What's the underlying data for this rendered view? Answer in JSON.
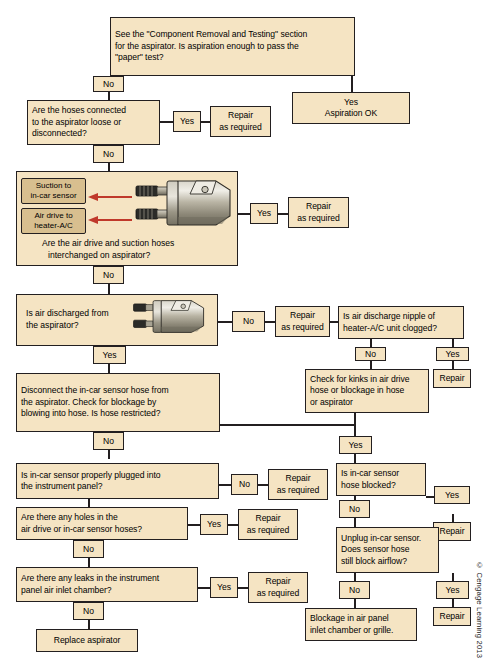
{
  "diagram": {
    "copyright": "© Cengage Learning 2013",
    "colors": {
      "box_fill": "#f5e4c3",
      "box_border": "#231f20",
      "label_fill": "#d8bf8f",
      "arrow_red": "#c0392b",
      "page_bg": "#ffffff"
    }
  },
  "nodes": {
    "start": {
      "line1": "See the \"Component Removal and Testing\" section",
      "line2": "for the aspirator. Is aspiration enough to pass the",
      "line3": "\"paper\" test?"
    },
    "aspiration_ok": {
      "line1": "Yes",
      "line2": "Aspiration OK"
    },
    "hoses_connected": {
      "line1": "Are the hoses connected",
      "line2": "to the aspirator loose or",
      "line3": "disconnected?"
    },
    "repair1": {
      "line1": "Repair",
      "line2": "as required"
    },
    "interchanged": {
      "caption1": "Are the air drive and suction hoses",
      "caption2": "interchanged on aspirator?",
      "label_suction_1": "Suction to",
      "label_suction_2": "in-car sensor",
      "label_airdrive_1": "Air drive to",
      "label_airdrive_2": "heater-A/C"
    },
    "repair2": {
      "line1": "Repair",
      "line2": "as required"
    },
    "air_discharged": {
      "line1": "Is air discharged from",
      "line2": "the aspirator?"
    },
    "repair3": {
      "line1": "Repair",
      "line2": "as required"
    },
    "nipple_clogged": {
      "line1": "Is air discharge nipple of",
      "line2": "heater-A/C unit clogged?"
    },
    "repair4": {
      "line1": "Repair"
    },
    "check_kinks": {
      "line1": "Check for kinks in air drive",
      "line2": "hose or blockage in hose",
      "line3": "or aspirator"
    },
    "disconnect_hose": {
      "line1": "Disconnect the in-car sensor hose from",
      "line2": "the aspirator. Check for blockage by",
      "line3": "blowing into hose. Is hose restricted?"
    },
    "sensor_plugged": {
      "line1": "Is in-car sensor properly plugged into",
      "line2": "the instrument panel?"
    },
    "repair5": {
      "line1": "Repair",
      "line2": "as required"
    },
    "hose_blocked": {
      "line1": "Is in-car sensor",
      "line2": "hose blocked?"
    },
    "repair6": {
      "line1": "Repair"
    },
    "holes_hoses": {
      "line1": "Are there any holes in the",
      "line2": "air drive or in-car sensor hoses?"
    },
    "repair7": {
      "line1": "Repair",
      "line2": "as required"
    },
    "unplug_sensor": {
      "line1": "Unplug in-car sensor.",
      "line2": "Does sensor hose",
      "line3": "still block airflow?"
    },
    "repair8": {
      "line1": "Repair"
    },
    "leaks_chamber": {
      "line1": "Are there any leaks in the instrument",
      "line2": "panel air inlet chamber?"
    },
    "repair9": {
      "line1": "Repair",
      "line2": "as required"
    },
    "blockage_panel": {
      "line1": "Blockage in air panel",
      "line2": "inlet chamber or grille."
    },
    "replace_aspirator": {
      "line1": "Replace aspirator"
    }
  },
  "tags": {
    "no1": "No",
    "yes1": "Yes",
    "no2": "No",
    "yes2": "Yes",
    "no3": "No",
    "no4": "No",
    "yes3": "Yes",
    "no5": "No",
    "yes4": "Yes",
    "yes5": "Yes",
    "no6": "No",
    "no7": "No",
    "yes6": "Yes",
    "no8": "No",
    "yes7": "Yes",
    "yes8": "Yes",
    "no9": "No",
    "no10": "No",
    "yes9": "Yes",
    "no11": "No"
  }
}
